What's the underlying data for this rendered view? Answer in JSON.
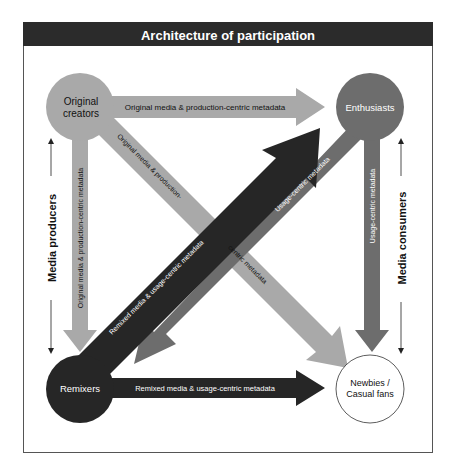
{
  "title": "Architecture of participation",
  "colors": {
    "title_bar": "#2b2b2b",
    "light_gray": "#a9a9a9",
    "medium_gray": "#6d6d6d",
    "dark": "#262626",
    "white": "#ffffff"
  },
  "nodes": {
    "original_creators": {
      "line1": "Original",
      "line2": "creators"
    },
    "enthusiasts": {
      "label": "Enthusiasts"
    },
    "remixers": {
      "label": "Remixers"
    },
    "newbies": {
      "line1": "Newbies /",
      "line2": "Casual fans"
    }
  },
  "arrows": {
    "oc_to_enthusiasts": "Original media & production-centric metadata",
    "oc_to_remixers": "Original media & production-centric metadata",
    "oc_to_newbies_part1": "Original media & production-",
    "oc_to_newbies_part2": "centric metadata",
    "remixers_to_newbies": "Remixed media & usage-centric metadata",
    "remixers_to_enthusiasts": "Remixed media & usage-centric metadata",
    "enthusiasts_to_remixers": "Usage-centric metadata",
    "enthusiasts_to_newbies": "Usage-centric metadata"
  },
  "side_labels": {
    "left": "Media producers",
    "right": "Media consumers"
  }
}
